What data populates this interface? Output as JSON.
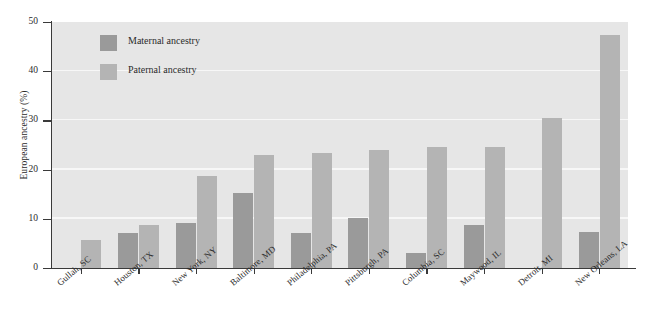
{
  "chart_data": {
    "type": "bar",
    "title": "",
    "xlabel": "",
    "ylabel": "European ancestry (%)",
    "ylim": [
      0,
      50
    ],
    "ytick_labels": [
      "0",
      "10",
      "20",
      "30",
      "40",
      "50"
    ],
    "ytick_values": [
      0,
      10,
      20,
      30,
      40,
      50
    ],
    "grid": true,
    "grid_axis": "y",
    "legend_position": "upper-left-inside",
    "categories": [
      "Gullah, SC",
      "Houston, TX",
      "New York, NY",
      "Baltimore, MD",
      "Philadelphia, PA",
      "Pittsburgh, PA",
      "Columbia, SC",
      "Maywood, IL",
      "Detroit, MI",
      "New Orleans, LA"
    ],
    "series": [
      {
        "name": "Maternal ancestry",
        "color": "#9a9a9a",
        "values": [
          null,
          7.2,
          9.2,
          15.2,
          7.2,
          10.2,
          3.0,
          8.7,
          null,
          7.3
        ]
      },
      {
        "name": "Paternal ancestry",
        "color": "#b4b4b4",
        "values": [
          5.7,
          8.8,
          18.8,
          23.0,
          23.4,
          24.0,
          24.5,
          24.5,
          30.5,
          47.4
        ]
      }
    ]
  },
  "figure": {
    "plot_background": "#e6e6e6",
    "gridline_color": "#f7f7f7",
    "axis_color": "#3a3a3a",
    "page_background": "#ffffff"
  }
}
